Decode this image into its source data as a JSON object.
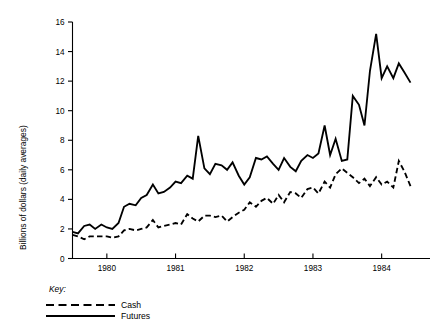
{
  "chart_data": {
    "type": "line",
    "title": "",
    "subtitle": "",
    "xlabel": "",
    "ylabel": "Billions of dollars (daily averages)",
    "xlim": [
      1979.5,
      1984.5
    ],
    "ylim": [
      0,
      16
    ],
    "yticks": [
      0,
      2,
      4,
      6,
      8,
      10,
      12,
      14,
      16
    ],
    "ytick_labels": [
      "0",
      "2",
      "4",
      "6",
      "8",
      "10",
      "12",
      "14",
      "16"
    ],
    "xticks": [
      1980,
      1981,
      1982,
      1983,
      1984
    ],
    "xtick_labels": [
      "1980",
      "1981",
      "1982",
      "1983",
      "1984"
    ],
    "grid": false,
    "legend_title": "Key:",
    "legend_position": "below-axes-left",
    "x": [
      1979.5,
      1979.58,
      1979.67,
      1979.75,
      1979.83,
      1979.92,
      1980.0,
      1980.08,
      1980.17,
      1980.25,
      1980.33,
      1980.42,
      1980.5,
      1980.58,
      1980.67,
      1980.75,
      1980.83,
      1980.92,
      1981.0,
      1981.08,
      1981.17,
      1981.25,
      1981.33,
      1981.42,
      1981.5,
      1981.58,
      1981.67,
      1981.75,
      1981.83,
      1981.92,
      1982.0,
      1982.08,
      1982.17,
      1982.25,
      1982.33,
      1982.42,
      1982.5,
      1982.58,
      1982.67,
      1982.75,
      1982.83,
      1982.92,
      1983.0,
      1983.08,
      1983.17,
      1983.25,
      1983.33,
      1983.42,
      1983.5,
      1983.58,
      1983.67,
      1983.75,
      1983.83,
      1983.92,
      1984.0,
      1984.08,
      1984.17,
      1984.25,
      1984.33,
      1984.42
    ],
    "series": [
      {
        "name": "Futures",
        "style": "solid",
        "color": "#000000",
        "values": [
          1.8,
          1.7,
          2.2,
          2.3,
          2.0,
          2.3,
          2.1,
          2.0,
          2.4,
          3.5,
          3.7,
          3.6,
          4.1,
          4.3,
          5.0,
          4.4,
          4.5,
          4.8,
          5.2,
          5.1,
          5.6,
          5.4,
          8.3,
          6.1,
          5.7,
          6.4,
          6.3,
          6.0,
          6.5,
          5.6,
          5.0,
          5.5,
          6.8,
          6.7,
          6.9,
          6.4,
          6.0,
          6.8,
          6.2,
          5.9,
          6.6,
          7.0,
          6.8,
          7.1,
          9.0,
          7.0,
          8.1,
          6.6,
          6.7,
          11.0,
          10.4,
          9.0,
          12.7,
          15.2,
          12.2,
          13.0,
          12.2,
          13.2,
          12.6,
          11.9
        ]
      },
      {
        "name": "Cash",
        "style": "dashed",
        "color": "#000000",
        "values": [
          1.6,
          1.5,
          1.3,
          1.5,
          1.5,
          1.5,
          1.5,
          1.4,
          1.5,
          1.9,
          2.0,
          1.9,
          2.0,
          2.1,
          2.6,
          2.1,
          2.2,
          2.3,
          2.4,
          2.3,
          3.0,
          2.7,
          2.5,
          2.9,
          2.9,
          2.8,
          2.9,
          2.5,
          2.8,
          3.1,
          3.3,
          3.8,
          3.5,
          3.9,
          4.1,
          3.7,
          4.3,
          3.8,
          4.5,
          4.4,
          4.1,
          4.7,
          4.8,
          4.4,
          5.2,
          4.8,
          5.7,
          6.1,
          5.8,
          5.5,
          5.1,
          5.4,
          4.9,
          5.5,
          5.0,
          5.2,
          4.8,
          6.6,
          5.9,
          4.9
        ]
      }
    ],
    "legend_entries": [
      {
        "label": "Cash",
        "style": "dashed"
      },
      {
        "label": "Futures",
        "style": "solid"
      }
    ]
  }
}
